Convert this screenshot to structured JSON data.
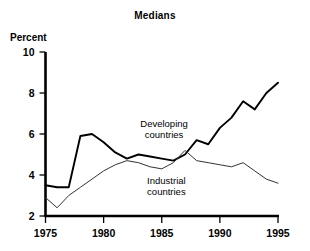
{
  "chart_data": {
    "type": "line",
    "title": "Medians",
    "xlabel": "",
    "ylabel": "Percent",
    "xlim": [
      1975,
      1995
    ],
    "ylim": [
      2,
      10
    ],
    "yticks": [
      2,
      4,
      6,
      8,
      10
    ],
    "xticks": [
      1975,
      1980,
      1985,
      1990,
      1995
    ],
    "grid": false,
    "legend_position": "inline-annotation",
    "x": [
      1975,
      1976,
      1977,
      1978,
      1979,
      1980,
      1981,
      1982,
      1983,
      1984,
      1985,
      1986,
      1987,
      1988,
      1989,
      1990,
      1991,
      1992,
      1993,
      1994,
      1995
    ],
    "series": [
      {
        "name": "Developing countries",
        "line_width": "thick",
        "color": "#000000",
        "values": [
          3.5,
          3.4,
          3.4,
          5.9,
          6.0,
          5.6,
          5.1,
          4.8,
          5.0,
          4.9,
          4.8,
          4.7,
          5.0,
          5.7,
          5.5,
          6.3,
          6.8,
          7.6,
          7.2,
          8.0,
          8.5
        ]
      },
      {
        "name": "Industrial countries",
        "line_width": "thin",
        "color": "#333333",
        "values": [
          2.9,
          2.4,
          3.0,
          3.4,
          3.8,
          4.2,
          4.5,
          4.7,
          4.6,
          4.4,
          4.3,
          4.6,
          5.2,
          4.7,
          4.6,
          4.5,
          4.4,
          4.6,
          4.2,
          3.8,
          3.6
        ]
      }
    ],
    "annotations": [
      {
        "text_line1": "Developing",
        "text_line2": "countries",
        "x": 1985.2,
        "y": 6.35
      },
      {
        "text_line1": "Industrial",
        "text_line2": "countries",
        "x": 1985.4,
        "y": 3.55
      }
    ]
  }
}
